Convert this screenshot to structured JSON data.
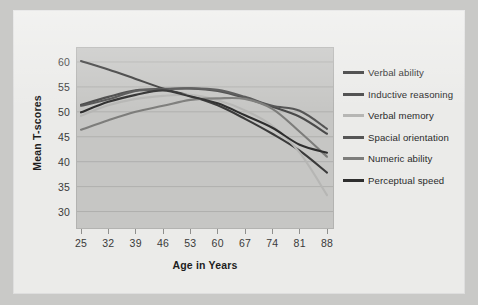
{
  "chart_data": {
    "type": "line",
    "title": "",
    "xlabel": "Age in Years",
    "ylabel": "Mean T-scores",
    "x": [
      25,
      32,
      39,
      46,
      53,
      60,
      67,
      74,
      81,
      88
    ],
    "xtick_labels": [
      "25",
      "32",
      "39",
      "46",
      "53",
      "60",
      "67",
      "74",
      "81",
      "88"
    ],
    "ytick_labels": [
      "30",
      "35",
      "40",
      "45",
      "50",
      "55",
      "60"
    ],
    "yticks": [
      30,
      35,
      40,
      45,
      50,
      55,
      60
    ],
    "xlim": [
      25,
      88
    ],
    "ylim": [
      27.5,
      62
    ],
    "grid": "horizontal",
    "legend_position": "right",
    "series": [
      {
        "name": "Verbal ability",
        "color": "#3a3a3a",
        "values": [
          60.2,
          58.5,
          56.6,
          54.7,
          53.2,
          51.3,
          48.6,
          45.6,
          42.2,
          37.8
        ]
      },
      {
        "name": "Inductive reasoning",
        "color": "#4a4a4a",
        "values": [
          51.4,
          53.0,
          54.3,
          54.6,
          54.7,
          54.2,
          52.8,
          51.0,
          49.0,
          45.6
        ]
      },
      {
        "name": "Verbal memory",
        "color": "#b6b6b4",
        "values": [
          49.2,
          51.3,
          52.6,
          53.2,
          53.4,
          52.3,
          50.3,
          47.2,
          41.8,
          33.3
        ]
      },
      {
        "name": "Spacial orientation",
        "color": "#555555",
        "values": [
          51.2,
          52.5,
          54.2,
          54.5,
          54.7,
          54.4,
          53.0,
          51.2,
          50.2,
          46.6
        ]
      },
      {
        "name": "Numeric ability",
        "color": "#7d7d7b",
        "values": [
          46.4,
          48.3,
          50.0,
          51.2,
          52.4,
          52.7,
          52.6,
          50.6,
          46.0,
          41.0
        ]
      },
      {
        "name": "Perceptual speed",
        "color": "#2e2e2e",
        "values": [
          49.9,
          52.0,
          53.4,
          54.3,
          53.1,
          51.7,
          49.3,
          46.8,
          43.4,
          41.8
        ]
      }
    ]
  },
  "legend": {
    "items": [
      {
        "label": "Verbal ability"
      },
      {
        "label": "Inductive reasoning"
      },
      {
        "label": "Verbal memory"
      },
      {
        "label": "Spacial orientation"
      },
      {
        "label": "Numeric ability"
      },
      {
        "label": "Perceptual speed"
      }
    ]
  }
}
